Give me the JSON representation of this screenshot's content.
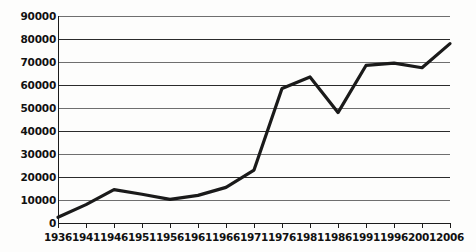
{
  "chart_data": {
    "type": "line",
    "title": "",
    "subtitle": "",
    "xlabel": "",
    "ylabel": "",
    "categories": [
      "1936",
      "1941",
      "1946",
      "1951",
      "1956",
      "1961",
      "1966",
      "1971",
      "1976",
      "1981",
      "1986",
      "1991",
      "1996",
      "2001",
      "2006"
    ],
    "x": [
      1936,
      1941,
      1946,
      1951,
      1956,
      1961,
      1966,
      1971,
      1976,
      1981,
      1986,
      1991,
      1996,
      2001,
      2006
    ],
    "values": [
      2500,
      8000,
      14500,
      12500,
      10300,
      12000,
      15500,
      23000,
      58500,
      63500,
      48000,
      68500,
      69500,
      67500,
      78000
    ],
    "series": [
      {
        "name": "",
        "values": [
          2500,
          8000,
          14500,
          12500,
          10300,
          12000,
          15500,
          23000,
          58500,
          63500,
          48000,
          68500,
          69500,
          67500,
          78000
        ]
      }
    ],
    "ylim": [
      0,
      90000
    ],
    "xlim": [
      1936,
      2006
    ],
    "yticks": [
      0,
      10000,
      20000,
      30000,
      40000,
      50000,
      60000,
      70000,
      80000,
      90000
    ],
    "ytick_labels": [
      "0",
      "10000",
      "20000",
      "30000",
      "40000",
      "50000",
      "60000",
      "70000",
      "80000",
      "90000"
    ],
    "xtick_labels": [
      "1936",
      "1941",
      "1946",
      "1951",
      "1956",
      "1961",
      "1966",
      "1971",
      "1976",
      "1981",
      "1986",
      "1991",
      "1996",
      "2001",
      "2006"
    ],
    "grid": true,
    "grid_axis": "y",
    "legend": false,
    "legend_position": "none",
    "line_color": "#1a1a1a",
    "grid_color": "#2b2b2b",
    "background_color": "#ffffff",
    "markers": false,
    "annotations": []
  }
}
